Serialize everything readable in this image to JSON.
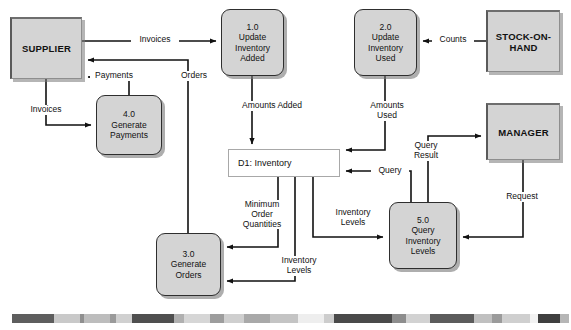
{
  "diagram": {
    "type": "data-flow-diagram",
    "width": 571,
    "height": 330,
    "colors": {
      "node_fill": "#d4d4d4",
      "node_stroke": "#2e2e2e",
      "entity_stroke": "#5a5a5a",
      "datastore_fill": "#ffffff",
      "datastore_stroke": "#a8a8a8",
      "flow_line": "#111111",
      "background": "#ffffff"
    }
  },
  "entities": [
    {
      "id": "supplier",
      "name": "SUPPLIER",
      "label": "SUPPLIER",
      "x": 10,
      "y": 17,
      "w": 72,
      "h": 62
    },
    {
      "id": "stock-on-hand",
      "name": "STOCK-ON-HAND",
      "label": "STOCK-ON-\nHAND",
      "x": 486,
      "y": 10,
      "w": 74,
      "h": 62
    },
    {
      "id": "manager",
      "name": "MANAGER",
      "label": "MANAGER",
      "x": 486,
      "y": 103,
      "w": 74,
      "h": 57
    }
  ],
  "processes": [
    {
      "id": "p1",
      "number": "1.0",
      "name": "Update Inventory Added",
      "label": "1.0\nUpdate\nInventory\nAdded",
      "x": 221,
      "y": 9,
      "w": 63,
      "h": 67
    },
    {
      "id": "p2",
      "number": "2.0",
      "name": "Update Inventory Used",
      "label": "2.0\nUpdate\nInventory\nUsed",
      "x": 354,
      "y": 9,
      "w": 63,
      "h": 67
    },
    {
      "id": "p3",
      "number": "3.0",
      "name": "Generate Orders",
      "label": "3.0\nGenerate\nOrders",
      "x": 156,
      "y": 233,
      "w": 65,
      "h": 63
    },
    {
      "id": "p4",
      "number": "4.0",
      "name": "Generate Payments",
      "label": "4.0\nGenerate\nPayments",
      "x": 96,
      "y": 95,
      "w": 66,
      "h": 60
    },
    {
      "id": "p5",
      "number": "5.0",
      "name": "Query Inventory Levels",
      "label": "5.0\nQuery\nInventory\nLevels",
      "x": 389,
      "y": 202,
      "w": 68,
      "h": 67
    }
  ],
  "datastores": [
    {
      "id": "d1",
      "number": "D1",
      "name": "Inventory",
      "label": "D1: Inventory",
      "x": 228,
      "y": 149,
      "w": 112,
      "h": 28
    }
  ],
  "flows": [
    {
      "id": "f1",
      "label": "Invoices",
      "from": "supplier",
      "to": "p1"
    },
    {
      "id": "f2",
      "label": "Orders",
      "from": "p3",
      "to": "supplier"
    },
    {
      "id": "f3",
      "label": "Payments",
      "from": "p4",
      "to": "supplier"
    },
    {
      "id": "f4",
      "label": "Invoices",
      "from": "supplier",
      "to": "p4"
    },
    {
      "id": "f5",
      "label": "Counts",
      "from": "stock-on-hand",
      "to": "p2"
    },
    {
      "id": "f6",
      "label": "Amounts Added",
      "from": "p1",
      "to": "d1"
    },
    {
      "id": "f7",
      "label": "Amounts\nUsed",
      "from": "p2",
      "to": "d1"
    },
    {
      "id": "f8",
      "label": "Minimum\nOrder\nQuantities",
      "from": "d1",
      "to": "p3"
    },
    {
      "id": "f9",
      "label": "Inventory\nLevels",
      "from": "d1",
      "to": "p3"
    },
    {
      "id": "f10",
      "label": "Inventory\nLevels",
      "from": "d1",
      "to": "p5"
    },
    {
      "id": "f11",
      "label": "Query",
      "from": "p5",
      "to": "d1"
    },
    {
      "id": "f12",
      "label": "Query\nResult",
      "from": "p5",
      "to": "manager"
    },
    {
      "id": "f13",
      "label": "Request",
      "from": "manager",
      "to": "p5"
    }
  ],
  "scan_strip": {
    "y": 314,
    "segments": [
      {
        "x": 12,
        "w": 42,
        "color": "#5e5e5e"
      },
      {
        "x": 54,
        "w": 26,
        "color": "#c9c9c9"
      },
      {
        "x": 80,
        "w": 4,
        "color": "#8f8f8f"
      },
      {
        "x": 84,
        "w": 26,
        "color": "#bdbdbd"
      },
      {
        "x": 110,
        "w": 6,
        "color": "#9a9a9a"
      },
      {
        "x": 116,
        "w": 16,
        "color": "#d0d0d0"
      },
      {
        "x": 132,
        "w": 42,
        "color": "#4f4f4f"
      },
      {
        "x": 174,
        "w": 10,
        "color": "#b0b0b0"
      },
      {
        "x": 184,
        "w": 26,
        "color": "#d6d6d6"
      },
      {
        "x": 210,
        "w": 14,
        "color": "#9d9d9d"
      },
      {
        "x": 224,
        "w": 20,
        "color": "#cfcfcf"
      },
      {
        "x": 244,
        "w": 26,
        "color": "#a9a9a9"
      },
      {
        "x": 270,
        "w": 28,
        "color": "#c4c4c4"
      },
      {
        "x": 298,
        "w": 26,
        "color": "#eeeeee"
      },
      {
        "x": 324,
        "w": 10,
        "color": "#cdcdcd"
      },
      {
        "x": 334,
        "w": 58,
        "color": "#4a4a4a"
      },
      {
        "x": 392,
        "w": 14,
        "color": "#8d8d8d"
      },
      {
        "x": 406,
        "w": 24,
        "color": "#d2d2d2"
      },
      {
        "x": 430,
        "w": 44,
        "color": "#5c5c5c"
      },
      {
        "x": 474,
        "w": 18,
        "color": "#c0c0c0"
      },
      {
        "x": 492,
        "w": 10,
        "color": "#9b9b9b"
      },
      {
        "x": 502,
        "w": 28,
        "color": "#cfcfcf"
      },
      {
        "x": 530,
        "w": 8,
        "color": "#f2f2f2"
      },
      {
        "x": 538,
        "w": 22,
        "color": "#3f3f3f"
      },
      {
        "x": 560,
        "w": 9,
        "color": "#b6b6b6"
      }
    ]
  }
}
